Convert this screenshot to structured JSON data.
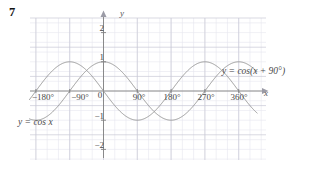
{
  "figure": {
    "question_number": "7",
    "axis_x_name": "x",
    "axis_y_name": "y",
    "curve_label_1": "y = cos x",
    "curve_label_2": "y = cos(x + 90°)",
    "colors": {
      "curve": "#9a9a9a",
      "axis": "#808080",
      "grid_major": "#c9c9d6",
      "grid_minor": "#e6e6ee",
      "text": "#4a4a4a",
      "background": "#ffffff"
    }
  },
  "chart_data": {
    "type": "line",
    "title": "",
    "xlabel": "x",
    "ylabel": "y",
    "xlim": [
      -225,
      405
    ],
    "ylim": [
      -2.6,
      2.4
    ],
    "grid": true,
    "grid_major_x_step": 90,
    "grid_major_y_step": 1,
    "grid_minor_per_major": 3,
    "legend": "inline-labels",
    "xticks": [
      -180,
      -90,
      0,
      90,
      180,
      270,
      360
    ],
    "xticklabels": [
      "−180°",
      "−90°",
      "0",
      "90°",
      "180°",
      "270°",
      "360°"
    ],
    "yticks": [
      -2,
      -1,
      1,
      2
    ],
    "yticklabels": [
      "−2",
      "−1",
      "1",
      "2"
    ],
    "series": [
      {
        "name": "y = cos x",
        "label": "y = cos x",
        "function": "cos(x)",
        "amplitude": 1,
        "period": 360,
        "phase_deg": 0,
        "maxima_deg": [
          -180,
          0,
          180,
          360
        ],
        "minima_deg": [
          -90,
          90,
          270
        ],
        "zeros_deg": [
          -135,
          -45,
          45,
          135,
          225,
          315
        ],
        "points": [
          {
            "x": -225,
            "y": -0.707
          },
          {
            "x": -180,
            "y": -1.0
          },
          {
            "x": -135,
            "y": -0.707
          },
          {
            "x": -90,
            "y": 0.0
          },
          {
            "x": -45,
            "y": 0.707
          },
          {
            "x": 0,
            "y": 1.0
          },
          {
            "x": 45,
            "y": 0.707
          },
          {
            "x": 90,
            "y": 0.0
          },
          {
            "x": 135,
            "y": -0.707
          },
          {
            "x": 180,
            "y": -1.0
          },
          {
            "x": 225,
            "y": -0.707
          },
          {
            "x": 270,
            "y": 0.0
          },
          {
            "x": 315,
            "y": 0.707
          },
          {
            "x": 360,
            "y": 1.0
          },
          {
            "x": 405,
            "y": 0.707
          }
        ]
      },
      {
        "name": "y = cos(x + 90)",
        "label": "y = cos(x + 90°)",
        "function": "cos(x + 90)",
        "amplitude": 1,
        "period": 360,
        "phase_deg": 90,
        "maxima_deg": [
          -270,
          -90,
          90,
          270
        ],
        "minima_deg": [
          -180,
          0,
          180,
          360
        ],
        "zeros_deg": [
          -225,
          -135,
          -45,
          45,
          135,
          225,
          315
        ],
        "points": [
          {
            "x": -225,
            "y": 0.707
          },
          {
            "x": -180,
            "y": 1.0
          },
          {
            "x": -135,
            "y": 0.707
          },
          {
            "x": -90,
            "y": 0.0
          },
          {
            "x": -45,
            "y": -0.707
          },
          {
            "x": 0,
            "y": -1.0
          },
          {
            "x": 45,
            "y": -0.707
          },
          {
            "x": 90,
            "y": 0.0
          },
          {
            "x": 135,
            "y": 0.707
          },
          {
            "x": 180,
            "y": 1.0
          },
          {
            "x": 225,
            "y": 0.707
          },
          {
            "x": 270,
            "y": 0.0
          },
          {
            "x": 315,
            "y": -0.707
          },
          {
            "x": 360,
            "y": -1.0
          },
          {
            "x": 405,
            "y": -0.707
          }
        ]
      }
    ],
    "annotations": [
      {
        "text": "y = cos x",
        "x_px": 18,
        "y_px": 118
      },
      {
        "text": "y = cos(x + 90°)",
        "x_px": 222,
        "y_px": 72
      }
    ]
  }
}
